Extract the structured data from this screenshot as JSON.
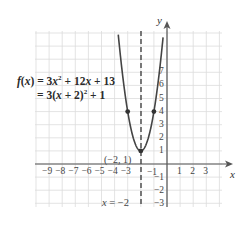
{
  "chart_data": {
    "type": "line",
    "title": "",
    "function": {
      "expanded": "f(x) = 3x² + 12x + 13",
      "vertex_form": "= 3(x + 2)² + 1",
      "a": 3,
      "h": -2,
      "k": 1
    },
    "xlabel": "x",
    "ylabel": "y",
    "xlim": [
      -10,
      4
    ],
    "ylim": [
      -4,
      9
    ],
    "x_ticks": [
      -9,
      -8,
      -7,
      -6,
      -5,
      -4,
      -3,
      -1,
      1,
      2,
      3
    ],
    "y_ticks": [
      -3,
      -2,
      -1,
      1,
      2,
      3,
      4,
      5,
      6,
      7
    ],
    "grid": true,
    "series": [
      {
        "name": "f(x)",
        "x": [
          -3.72,
          -3,
          -2.5,
          -2,
          -1.5,
          -1,
          -0.28
        ],
        "y": [
          9.9,
          4,
          1.75,
          1,
          1.75,
          4,
          9.9
        ]
      }
    ],
    "points": [
      {
        "x": -3,
        "y": 4
      },
      {
        "x": -2,
        "y": 1,
        "label": "(−2, 1)"
      },
      {
        "x": -1,
        "y": 4
      }
    ],
    "axis_of_symmetry": {
      "x": -2,
      "label": "x = −2",
      "style": "dashed"
    }
  },
  "labels": {
    "eq_line1": "f(x) = 3x² + 12x + 13",
    "eq_line2": "= 3(x + 2)² + 1",
    "vertex": "(−2, 1)",
    "axis": "x = −2",
    "x_axis": "x",
    "y_axis": "y",
    "x_ticks": [
      "−9",
      "−8",
      "−7",
      "−6",
      "−5",
      "−4",
      "−3",
      "−1",
      "1",
      "2",
      "3"
    ],
    "y_ticks_pos": [
      "1",
      "2",
      "3",
      "4",
      "5",
      "6",
      "7"
    ],
    "y_ticks_neg": [
      "−1",
      "−2",
      "−3"
    ]
  }
}
